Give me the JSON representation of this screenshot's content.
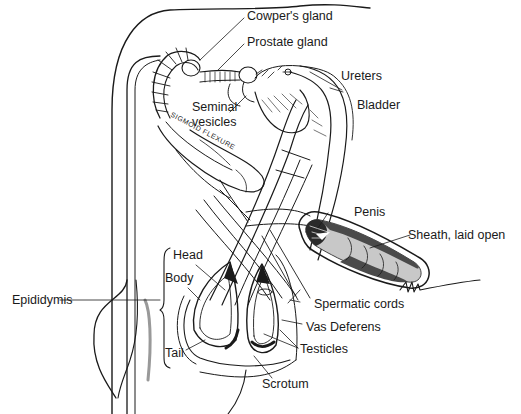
{
  "diagram": {
    "labels": {
      "cowpers_gland": "Cowper's gland",
      "prostate_gland": "Prostate gland",
      "ureters": "Ureters",
      "bladder": "Bladder",
      "seminal_vesicles_line1": "Seminal",
      "seminal_vesicles_line2": "vesicles",
      "sigmoid_flexure": "SIGMOID FLEXURE",
      "penis": "Penis",
      "sheath": "Sheath, laid open",
      "head": "Head",
      "body": "Body",
      "tail": "Tail",
      "epididymis": "Epididymis",
      "spermatic_cords": "Spermatic cords",
      "vas_deferens": "Vas Deferens",
      "testicles": "Testicles",
      "scrotum": "Scrotum"
    },
    "colors": {
      "line": "#1a1a1a",
      "fill_dark": "#2a2a2a",
      "fill_mid": "#8a8a8a",
      "fill_light": "#c8c8c8",
      "background": "#ffffff"
    }
  }
}
